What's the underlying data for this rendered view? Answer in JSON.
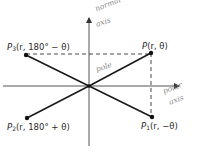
{
  "diagram": {
    "title": "",
    "pole": {
      "label": "pole",
      "x": 89,
      "y": 86
    },
    "axes": {
      "normal_axis": {
        "label_line1": "normal",
        "label_line2": "axis",
        "x": 89,
        "y_top": 17,
        "y_bottom": 146
      },
      "polar_axis": {
        "label_line1": "polar",
        "label_line2": "axis",
        "y": 86,
        "x_left": 3,
        "x_right": 180
      }
    },
    "points": [
      {
        "id": "P",
        "name": "P",
        "sub": "",
        "coords": "(r, θ)",
        "x": 151,
        "y": 53
      },
      {
        "id": "P3",
        "name": "P",
        "sub": "3",
        "coords": "(r, 180° − θ)",
        "x": 26,
        "y": 55
      },
      {
        "id": "P2",
        "name": "P",
        "sub": "2",
        "coords": "(r, 180° + θ)",
        "x": 27,
        "y": 118
      },
      {
        "id": "P1",
        "name": "P",
        "sub": "1",
        "coords": "(r, −θ)",
        "x": 152,
        "y": 117
      }
    ],
    "dashed_lines": [
      {
        "from": "P3",
        "to": "P",
        "orientation": "horizontal"
      },
      {
        "from": "P",
        "to": "P1",
        "orientation": "vertical"
      }
    ],
    "colors": {
      "ink": "#1a1a1a",
      "axis": "#555555",
      "handwriting": "#8a8a8a",
      "background": "#ffffff"
    }
  }
}
